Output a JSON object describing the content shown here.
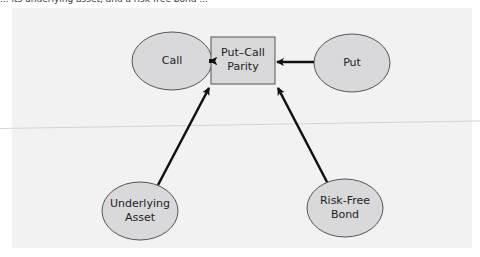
{
  "caption": {
    "text": "... its underlying asset, and a risk-free bond ..."
  },
  "diagram": {
    "type": "flow",
    "center": {
      "label_line1": "Put–Call",
      "label_line2": "Parity"
    },
    "nodes": [
      {
        "id": "call",
        "label_line1": "Call",
        "label_line2": ""
      },
      {
        "id": "put",
        "label_line1": "Put",
        "label_line2": ""
      },
      {
        "id": "underlying",
        "label_line1": "Underlying",
        "label_line2": "Asset"
      },
      {
        "id": "bond",
        "label_line1": "Risk-Free",
        "label_line2": "Bond"
      }
    ],
    "edges": [
      {
        "from": "Call",
        "to": "Put–Call Parity"
      },
      {
        "from": "Put",
        "to": "Put–Call Parity"
      },
      {
        "from": "Underlying Asset",
        "to": "Put–Call Parity"
      },
      {
        "from": "Risk-Free Bond",
        "to": "Put–Call Parity"
      }
    ],
    "colors": {
      "node_fill": "#d9d9db",
      "node_stroke": "#555555",
      "arrow": "#111111",
      "panel": "#f2f2f3"
    }
  }
}
